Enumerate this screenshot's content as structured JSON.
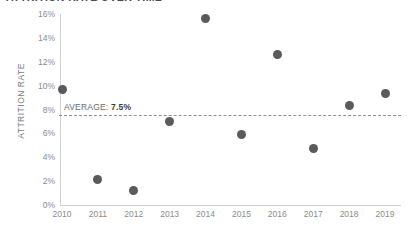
{
  "chart_data": {
    "type": "scatter",
    "title": "ATTRITION RATE OVER TIME",
    "xlabel": "",
    "ylabel": "ATTRITION RATE",
    "categories": [
      "2010",
      "2011",
      "2012",
      "2013",
      "2014",
      "2015",
      "2016",
      "2017",
      "2018",
      "2019"
    ],
    "x": [
      2010,
      2011,
      2012,
      2013,
      2014,
      2015,
      2016,
      2017,
      2018,
      2019
    ],
    "values": [
      9.7,
      2.1,
      1.2,
      7.0,
      15.6,
      5.9,
      12.6,
      4.7,
      8.3,
      9.3
    ],
    "ylim": [
      0,
      16
    ],
    "xlim": [
      2010,
      2019
    ],
    "y_tick_labels": [
      "16%",
      "14%",
      "12%",
      "10%",
      "8%",
      "6%",
      "4%",
      "2%",
      "0%"
    ],
    "y_tick_values": [
      16,
      14,
      12,
      10,
      8,
      6,
      4,
      2,
      0
    ],
    "grid": false,
    "legend": false,
    "point_color": "#5a5a5a",
    "axis_color": "#d2d2d2",
    "tick_label_color": "#8c8c8c",
    "annotations": [
      {
        "name": "average-line",
        "label_prefix": "AVERAGE:",
        "label_value": "7.5%",
        "value": 7.5,
        "style": "dashed",
        "color": "#8f8f8f"
      }
    ]
  }
}
